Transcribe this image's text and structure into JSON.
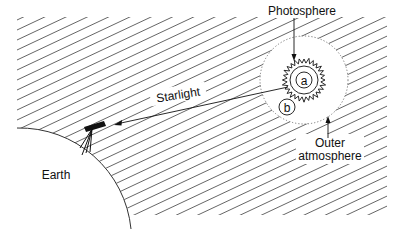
{
  "diagram": {
    "labels": {
      "photosphere": "Photosphere",
      "starlight": "Starlight",
      "earth": "Earth",
      "outer_line1": "Outer",
      "outer_line2": "atmosphere",
      "region_a": "a",
      "region_b": "b"
    },
    "icons": {
      "telescope": "telescope-icon",
      "star": "star-icon",
      "earth": "earth-surface"
    },
    "colors": {
      "ink": "#111111",
      "hatch": "#555555",
      "background": "#ffffff"
    }
  }
}
